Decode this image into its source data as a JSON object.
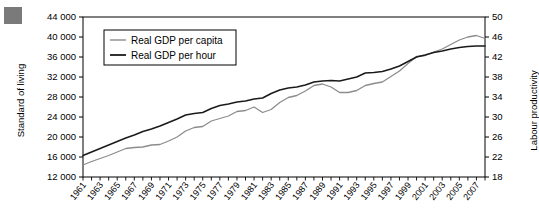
{
  "figure": {
    "marker_color": "#7a7a7a",
    "axis_left_title": "Standard of living",
    "axis_right_title": "Labour productivity"
  },
  "legend": {
    "items": [
      {
        "label": "Real GDP per capita",
        "color": "#8c8c8c"
      },
      {
        "label": "Real GDP per hour",
        "color": "#1a1a1a"
      }
    ]
  },
  "chart_data": {
    "type": "line",
    "title": "",
    "subtitle": "",
    "xlabel": "",
    "ylabel": "Standard of living",
    "y2label": "Labour productivity",
    "grid": false,
    "legend_position": "top-left",
    "xlim": [
      1961,
      2008
    ],
    "ylim": [
      12000,
      44000
    ],
    "y2lim": [
      18,
      50
    ],
    "yticks": [
      "12 000",
      "16 000",
      "20 000",
      "24 000",
      "28 000",
      "32 000",
      "36 000",
      "40 000",
      "44 000"
    ],
    "ytick_values": [
      12000,
      16000,
      20000,
      24000,
      28000,
      32000,
      36000,
      40000,
      44000
    ],
    "y2ticks": [
      "18",
      "22",
      "26",
      "30",
      "34",
      "38",
      "42",
      "46",
      "50"
    ],
    "y2tick_values": [
      18,
      22,
      26,
      30,
      34,
      38,
      42,
      46,
      50
    ],
    "xticks": [
      "1961",
      "1963",
      "1965",
      "1967",
      "1969",
      "1971",
      "1973",
      "1975",
      "1977",
      "1979",
      "1981",
      "1983",
      "1985",
      "1987",
      "1989",
      "1991",
      "1993",
      "1995",
      "1997",
      "1999",
      "2001",
      "2003",
      "2005",
      "2007"
    ],
    "xtick_values": [
      1961,
      1963,
      1965,
      1967,
      1969,
      1971,
      1973,
      1975,
      1977,
      1979,
      1981,
      1983,
      1985,
      1987,
      1989,
      1991,
      1993,
      1995,
      1997,
      1999,
      2001,
      2003,
      2005,
      2007
    ],
    "x": [
      1961,
      1962,
      1963,
      1964,
      1965,
      1966,
      1967,
      1968,
      1969,
      1970,
      1971,
      1972,
      1973,
      1974,
      1975,
      1976,
      1977,
      1978,
      1979,
      1980,
      1981,
      1982,
      1983,
      1984,
      1985,
      1986,
      1987,
      1988,
      1989,
      1990,
      1991,
      1992,
      1993,
      1994,
      1995,
      1996,
      1997,
      1998,
      1999,
      2000,
      2001,
      2002,
      2003,
      2004,
      2005,
      2006,
      2007,
      2008
    ],
    "series": [
      {
        "name": "Real GDP per capita",
        "axis": "left",
        "color": "#8c8c8c",
        "values": [
          14400,
          15100,
          15700,
          16300,
          17000,
          17700,
          17900,
          18000,
          18400,
          18500,
          19200,
          20000,
          21200,
          21900,
          22100,
          23200,
          23700,
          24200,
          25100,
          25300,
          26000,
          24900,
          25500,
          26900,
          27900,
          28300,
          29200,
          30300,
          30600,
          30000,
          28900,
          28900,
          29300,
          30300,
          30700,
          31000,
          32100,
          33200,
          34700,
          36100,
          36300,
          37000,
          37600,
          38500,
          39400,
          40000,
          40300,
          39700
        ]
      },
      {
        "name": "Real GDP per hour",
        "axis": "right",
        "color": "#1a1a1a",
        "values": [
          22.3,
          23.0,
          23.7,
          24.4,
          25.1,
          25.8,
          26.4,
          27.1,
          27.6,
          28.2,
          28.9,
          29.6,
          30.4,
          30.7,
          30.9,
          31.7,
          32.3,
          32.6,
          33.0,
          33.2,
          33.6,
          33.8,
          34.7,
          35.4,
          35.8,
          36.0,
          36.4,
          37.0,
          37.2,
          37.3,
          37.2,
          37.6,
          38.0,
          38.8,
          38.9,
          39.1,
          39.6,
          40.2,
          41.1,
          42.0,
          42.4,
          42.9,
          43.2,
          43.6,
          43.9,
          44.1,
          44.2,
          44.2
        ]
      }
    ]
  }
}
